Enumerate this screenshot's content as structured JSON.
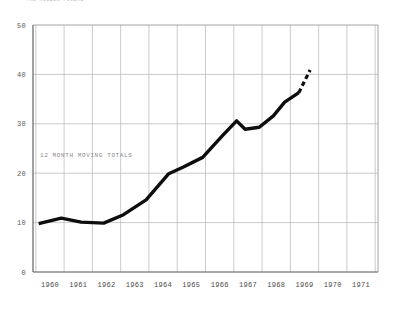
{
  "header": {
    "note": "THE HIDDEN FIGURE"
  },
  "annotations": {
    "series_label": "12 MONTH MOVING TOTALS"
  },
  "chart_data": {
    "type": "line",
    "title": "",
    "subtitle": "",
    "xlabel": "",
    "ylabel": "",
    "xlim": [
      1959.4,
      1971.6
    ],
    "ylim": [
      0,
      50
    ],
    "yticks": [
      0,
      10,
      20,
      30,
      40,
      50
    ],
    "ytick_labels": [
      "0",
      "10",
      "20",
      "30",
      "40",
      "50"
    ],
    "xticks": [
      1960,
      1961,
      1962,
      1963,
      1964,
      1965,
      1966,
      1967,
      1968,
      1969,
      1970,
      1971
    ],
    "xtick_labels": [
      "1960",
      "1961",
      "1962",
      "1963",
      "1964",
      "1965",
      "1966",
      "1967",
      "1968",
      "1969",
      "1970",
      "1971"
    ],
    "grid": true,
    "grid_color": "#b4b4b4",
    "legend": false,
    "legend_position": "none",
    "line_color": "#0d0d0d",
    "series": [
      {
        "name": "12 MONTH MOVING TOTALS",
        "style": "solid",
        "x": [
          1959.6,
          1960.4,
          1961.1,
          1961.9,
          1962.6,
          1963.4,
          1964.2,
          1964.7,
          1965.4,
          1966.1,
          1966.6,
          1966.9,
          1967.4,
          1967.9,
          1968.3,
          1968.8
        ],
        "values": [
          9.8,
          10.9,
          10.1,
          9.9,
          11.6,
          14.6,
          19.9,
          21.2,
          23.2,
          27.6,
          30.6,
          28.9,
          29.3,
          31.6,
          34.4,
          36.3
        ]
      },
      {
        "name": "12 MONTH MOVING TOTALS (projected)",
        "style": "dashed",
        "x": [
          1968.8,
          1969.2
        ],
        "values": [
          36.3,
          40.9
        ]
      }
    ]
  }
}
